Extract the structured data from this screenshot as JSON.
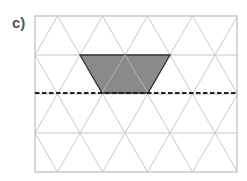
{
  "figure": {
    "label": "c)",
    "grid": {
      "type": "isometric-triangle-grid",
      "rows": 4,
      "box": {
        "x": 35,
        "y": 16,
        "width": 202,
        "height": 156
      },
      "row_height": 39,
      "triangle_base": 45,
      "line_color": "#c8c8c8",
      "border_color": "#bdbdbd"
    },
    "shape": {
      "type": "trapezoid",
      "fill": "#8a8a8a",
      "stroke": "#333333",
      "points": [
        [
          80,
          55
        ],
        [
          170,
          55
        ],
        [
          148,
          93
        ],
        [
          102,
          93
        ]
      ],
      "inner_lines": [
        [
          [
            102,
            93
          ],
          [
            125,
            55
          ]
        ],
        [
          [
            125,
            55
          ],
          [
            148,
            93
          ]
        ]
      ]
    },
    "mirror_line": {
      "style": "dashed",
      "y": 93,
      "x1": 35,
      "x2": 237,
      "color": "#222222"
    }
  }
}
